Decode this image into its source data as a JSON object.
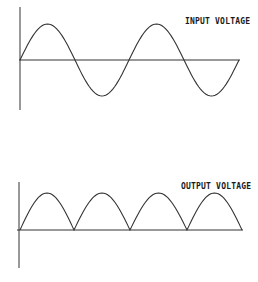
{
  "diagram": {
    "panels": [
      {
        "id": "input",
        "label": "INPUT VOLTAGE",
        "waveform": "sine",
        "cycles": 2,
        "axis": {
          "x": 20,
          "y_top": 7,
          "y_bottom": 110,
          "baseline_y": 60,
          "x_end": 240
        },
        "amplitude_px": 36,
        "zero_crossings_x": [
          20,
          75,
          129,
          184,
          239
        ]
      },
      {
        "id": "output",
        "label": "OUTPUT VOLTAGE",
        "waveform": "rectified-sine",
        "humps": 4,
        "axis": {
          "x": 19,
          "y_top": 182,
          "y_bottom": 268,
          "baseline_y": 230,
          "x_end": 243
        },
        "amplitude_px": 37,
        "zero_crossings_x": [
          20,
          74,
          130,
          187,
          242
        ]
      }
    ],
    "colors": {
      "stroke": "#333333",
      "background": "#ffffff",
      "text": "#1a1a1a"
    }
  }
}
